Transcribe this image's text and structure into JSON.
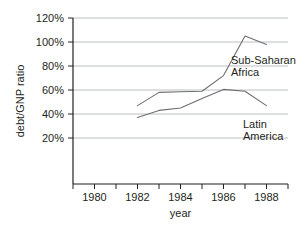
{
  "chart_data": {
    "type": "line",
    "title": "",
    "subtitle": "",
    "xlabel": "year",
    "ylabel": "debt/GNP ratio",
    "xlim": [
      1979,
      1989
    ],
    "ylim": [
      0,
      120
    ],
    "grid": true,
    "grid_axis": "y",
    "legend_position": "inline-annotation",
    "x_tick_labels": [
      "1980",
      "1982",
      "1984",
      "1986",
      "1988"
    ],
    "x_tick_values": [
      1980,
      1982,
      1984,
      1986,
      1988
    ],
    "x_minor_tick_values": [
      1979,
      1981,
      1983,
      1985,
      1987,
      1989
    ],
    "y_tick_labels": [
      "20%",
      "40%",
      "60%",
      "80%",
      "100%",
      "120%"
    ],
    "y_tick_values": [
      20,
      40,
      60,
      80,
      100,
      120
    ],
    "series": [
      {
        "name": "Sub-Saharan Africa",
        "label_lines": [
          "Sub-Saharan",
          "Africa"
        ],
        "color": "#6d6e71",
        "x": [
          1982,
          1983,
          1984,
          1985,
          1986,
          1987,
          1988
        ],
        "values": [
          47,
          58,
          58.5,
          59,
          72,
          105,
          98
        ]
      },
      {
        "name": "Latin America",
        "label_lines": [
          "Latin",
          "America"
        ],
        "color": "#6d6e71",
        "x": [
          1982,
          1983,
          1984,
          1985,
          1986,
          1987,
          1988
        ],
        "values": [
          37,
          43,
          45,
          53,
          60.5,
          59,
          47
        ]
      }
    ],
    "annotations": [
      {
        "text": "Sub-Saharan Africa",
        "series": "Sub-Saharan Africa",
        "x": 1986.6,
        "y": 86
      },
      {
        "text": "Latin America",
        "series": "Latin America",
        "x": 1987.0,
        "y": 45
      }
    ],
    "colors": {
      "line": "#6d6e71",
      "axis": "#231f20",
      "grid": "#bcbec0",
      "background": "#ffffff",
      "text": "#231f20"
    }
  }
}
